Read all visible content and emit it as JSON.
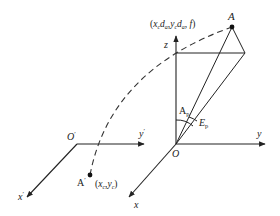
{
  "diagram": {
    "type": "coordinate-projection",
    "colors": {
      "stroke": "#222222",
      "background": "#ffffff"
    },
    "labels": {
      "point_A": "A",
      "point_A_coords_prefix": "(x",
      "point_A_coords": "(x_c d_a, y_c d_a, f)",
      "z_axis": "z",
      "y_axis": "y",
      "x_axis": "x",
      "origin": "O",
      "origin_prime": "O",
      "prime": "′",
      "y_prime_axis": "y",
      "x_prime_axis": "x",
      "point_A_prime": "A",
      "point_A_prime_coords": "(x_c, y_c)",
      "angle_azimuth": "A",
      "angle_elevation": "E",
      "subscript_p": "p",
      "subscript_c": "c",
      "subscript_a": "a"
    }
  }
}
